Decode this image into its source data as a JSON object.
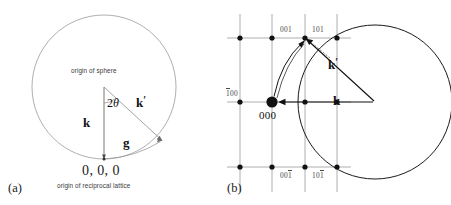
{
  "figure": {
    "panels": [
      {
        "tag": "(a)",
        "title_note": "origin of sphere",
        "bottom_note": "origin of reciprocal lattice",
        "origin_label": "0, 0, 0",
        "vectors": [
          {
            "name": "k",
            "label": "k"
          },
          {
            "name": "k-prime",
            "label": "k",
            "prime": "′"
          },
          {
            "name": "g",
            "label": "g"
          }
        ],
        "angle_label": "2",
        "angle_symbol": "θ"
      },
      {
        "tag": "(b)",
        "origin_label": "000",
        "vectors": [
          {
            "name": "k",
            "label": "k"
          },
          {
            "name": "k-prime",
            "label": "k",
            "prime": "′"
          }
        ],
        "lattice_labels": [
          {
            "name": "label-001-top",
            "pre": "",
            "digits": "001",
            "bar": ""
          },
          {
            "name": "label-101-top",
            "pre": "",
            "digits": "101",
            "bar": ""
          },
          {
            "name": "label-1bar00-left",
            "pre": "1",
            "digits": "00",
            "bar": "1"
          },
          {
            "name": "label-001bar-bottom",
            "pre": "00",
            "digits": "",
            "bar": "1"
          },
          {
            "name": "label-101bar-bottom",
            "pre": "10",
            "digits": "",
            "bar": "1"
          }
        ]
      }
    ],
    "colors": {
      "line": "#555555",
      "grid": "#9a9a9a",
      "dot": "#111111",
      "circle_a": "#8a8a8a",
      "circle_b": "#1a1a1a",
      "text": "#111111"
    }
  }
}
